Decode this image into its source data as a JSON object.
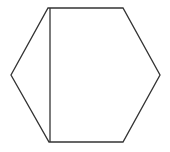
{
  "diagram": {
    "width": 170,
    "height": 152,
    "background": "#ffffff",
    "stroke_color": "#333333",
    "stroke_width": 1.3,
    "shapes": [
      {
        "type": "polygon",
        "name": "hexagon",
        "points": [
          [
            48,
            8
          ],
          [
            123,
            8
          ],
          [
            160,
            75
          ],
          [
            123,
            142
          ],
          [
            49,
            142
          ],
          [
            11,
            75
          ]
        ]
      },
      {
        "type": "line",
        "name": "vertical-chord",
        "from": [
          50,
          8
        ],
        "to": [
          50,
          142
        ]
      }
    ]
  }
}
